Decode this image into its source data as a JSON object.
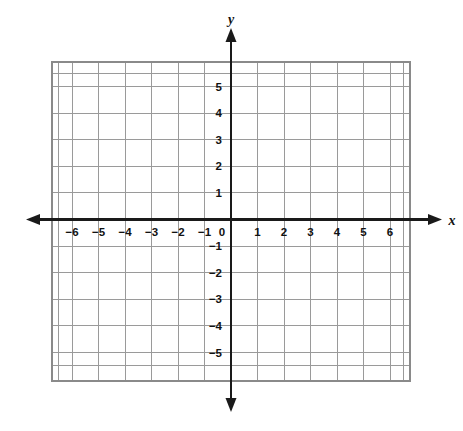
{
  "chart_data": {
    "type": "scatter",
    "title": "",
    "subtitle": "",
    "xlabel": "x",
    "ylabel": "y",
    "grid": true,
    "legend": "none",
    "series": [],
    "x": [],
    "values": [],
    "xlim": [
      -6.5,
      6.5
    ],
    "ylim": [
      -5.5,
      5.5
    ],
    "x_tick_values": [
      -6,
      -5,
      -4,
      -3,
      -2,
      -1,
      0,
      1,
      2,
      3,
      4,
      5,
      6
    ],
    "y_tick_values": [
      5,
      4,
      3,
      2,
      1,
      -1,
      -2,
      -3,
      -4,
      -5
    ],
    "x_tick_labels": [
      "−6",
      "−5",
      "−4",
      "−3",
      "−2",
      "−1",
      "0",
      "1",
      "2",
      "3",
      "4",
      "5",
      "6"
    ],
    "y_tick_labels": [
      "5",
      "4",
      "3",
      "2",
      "1",
      "−1",
      "−2",
      "−3",
      "−4",
      "−5"
    ],
    "origin_label": "0",
    "annotations": []
  },
  "axes": {
    "x_axis_name": "x",
    "y_axis_name": "y"
  },
  "ticks": {
    "x": [
      {
        "value": -6,
        "label": "−6"
      },
      {
        "value": -5,
        "label": "−5"
      },
      {
        "value": -4,
        "label": "−4"
      },
      {
        "value": -3,
        "label": "−3"
      },
      {
        "value": -2,
        "label": "−2"
      },
      {
        "value": -1,
        "label": "−1"
      },
      {
        "value": 1,
        "label": "1"
      },
      {
        "value": 2,
        "label": "2"
      },
      {
        "value": 3,
        "label": "3"
      },
      {
        "value": 4,
        "label": "4"
      },
      {
        "value": 5,
        "label": "5"
      },
      {
        "value": 6,
        "label": "6"
      }
    ],
    "y": [
      {
        "value": 5,
        "label": "5"
      },
      {
        "value": 4,
        "label": "4"
      },
      {
        "value": 3,
        "label": "3"
      },
      {
        "value": 2,
        "label": "2"
      },
      {
        "value": 1,
        "label": "1"
      },
      {
        "value": -1,
        "label": "−1"
      },
      {
        "value": -2,
        "label": "−2"
      },
      {
        "value": -3,
        "label": "−3"
      },
      {
        "value": -4,
        "label": "−4"
      },
      {
        "value": -5,
        "label": "−5"
      }
    ],
    "origin": {
      "value": 0,
      "label": "0"
    }
  },
  "colors": {
    "grid": "#9a9a9a",
    "grid_border": "#8a8a8a",
    "axis": "#1a1a1a",
    "text": "#111111",
    "background": "#ffffff"
  }
}
